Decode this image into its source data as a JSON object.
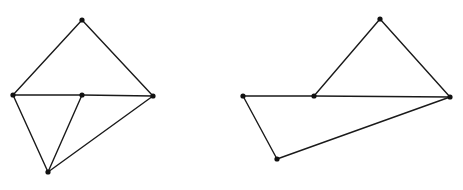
{
  "canvas": {
    "width": 463,
    "height": 190,
    "background": "#ffffff",
    "stroke_color": "#1a1a1a",
    "vertex_color": "#111111"
  },
  "figures": [
    {
      "name": "left-graph",
      "vertices": [
        {
          "id": "A",
          "x": 82,
          "y": 20
        },
        {
          "id": "B",
          "x": 13,
          "y": 95
        },
        {
          "id": "C",
          "x": 82,
          "y": 95
        },
        {
          "id": "D",
          "x": 153,
          "y": 96
        },
        {
          "id": "E",
          "x": 48,
          "y": 172
        }
      ],
      "edges": [
        [
          "A",
          "B"
        ],
        [
          "A",
          "D"
        ],
        [
          "B",
          "C"
        ],
        [
          "C",
          "D"
        ],
        [
          "C",
          "E"
        ],
        [
          "B",
          "E"
        ],
        [
          "D",
          "E"
        ]
      ]
    },
    {
      "name": "right-graph",
      "vertices": [
        {
          "id": "A",
          "x": 380,
          "y": 19
        },
        {
          "id": "B",
          "x": 243,
          "y": 96
        },
        {
          "id": "C",
          "x": 314,
          "y": 96
        },
        {
          "id": "D",
          "x": 450,
          "y": 97
        },
        {
          "id": "E",
          "x": 277,
          "y": 159
        }
      ],
      "edges": [
        [
          "A",
          "C"
        ],
        [
          "A",
          "D"
        ],
        [
          "B",
          "C"
        ],
        [
          "C",
          "D"
        ],
        [
          "B",
          "E"
        ],
        [
          "E",
          "D"
        ]
      ]
    }
  ]
}
